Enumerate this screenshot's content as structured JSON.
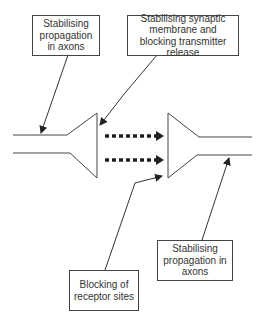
{
  "diagram": {
    "labels": {
      "axon_left": "Stabilising propagation in axons",
      "synaptic_membrane": "Stabilising synaptic membrane and blocking transmitter release",
      "receptor": "Blocking of receptor sites",
      "axon_right": "Stabilising propagation in axons"
    },
    "colors": {
      "line": "#333333",
      "box_border": "#444444",
      "text": "#333333"
    }
  }
}
